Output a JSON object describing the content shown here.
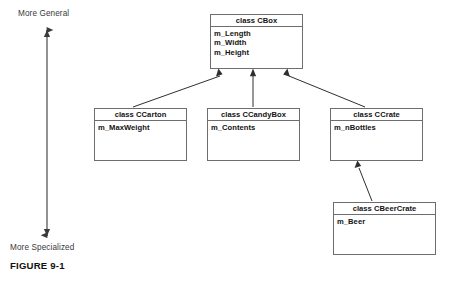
{
  "figure": {
    "caption": "FIGURE 9-1"
  },
  "axis": {
    "top_label": "More General",
    "bottom_label": "More Specialized",
    "orientation": "vertical",
    "arrow_color": "#3a3a3a"
  },
  "diagram": {
    "type": "uml-class-inheritance",
    "line_color": "#6d6d6d",
    "connector_color": "#3a3a3a",
    "background": "#ffffff",
    "classes": [
      {
        "id": "cbox",
        "header": "class CBox",
        "members": [
          "m_Length",
          "m_Width",
          "m_Height"
        ]
      },
      {
        "id": "ccarton",
        "header": "class CCarton",
        "members": [
          "m_MaxWeight"
        ]
      },
      {
        "id": "ccandybox",
        "header": "class CCandyBox",
        "members": [
          "m_Contents"
        ]
      },
      {
        "id": "ccrate",
        "header": "class CCrate",
        "members": [
          "m_nBottles"
        ]
      },
      {
        "id": "cbeercrate",
        "header": "class CBeerCrate",
        "members": [
          "m_Beer"
        ]
      }
    ],
    "inheritance": [
      {
        "from": "ccarton",
        "to": "cbox"
      },
      {
        "from": "ccandybox",
        "to": "cbox"
      },
      {
        "from": "ccrate",
        "to": "cbox"
      },
      {
        "from": "cbeercrate",
        "to": "ccrate"
      }
    ]
  }
}
